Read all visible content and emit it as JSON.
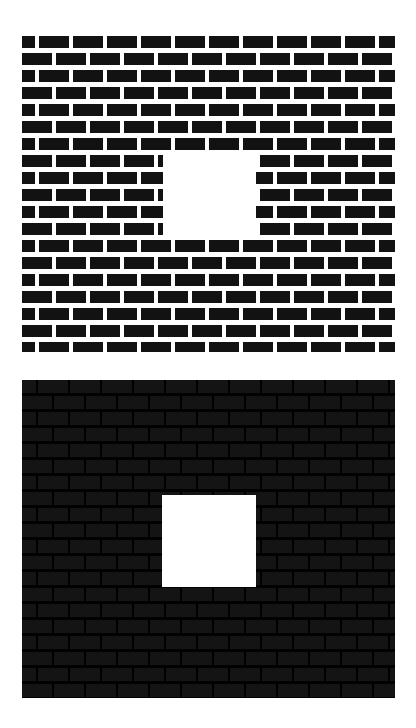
{
  "stimulus": {
    "title": "Brick wall aperture stimulus",
    "description": "Two brick-wall textures, each interrupted by a white rectangular aperture.",
    "canvas": {
      "width": 416,
      "height": 728,
      "background_color": "#ffffff"
    },
    "panels": [
      {
        "id": "panel-light",
        "name": "High-contrast brick wall with light mortar",
        "contrast_label": "light-mortar",
        "x": 22,
        "y": 36,
        "width": 373,
        "height": 316,
        "brick_color": "#121212",
        "mortar_color": "#ffffff",
        "row_height": 17,
        "brick_height": 12,
        "brick_width": 30,
        "mortar_gap": 4,
        "row_count": 19,
        "aperture": {
          "name": "white-aperture-top",
          "x": 141,
          "y": 119,
          "width": 93,
          "height": 85,
          "color": "#ffffff"
        }
      },
      {
        "id": "panel-dark",
        "name": "Low-contrast brick wall with dark mortar",
        "contrast_label": "dark-mortar",
        "x": 22,
        "y": 380,
        "width": 373,
        "height": 318,
        "brick_color": "#141414",
        "mortar_color": "#010101",
        "row_height": 16,
        "brick_height": 13,
        "brick_width": 30,
        "mortar_gap": 2,
        "row_count": 20,
        "aperture": {
          "name": "white-aperture-bottom",
          "x": 140,
          "y": 115,
          "width": 94,
          "height": 92,
          "color": "#ffffff"
        }
      }
    ]
  }
}
